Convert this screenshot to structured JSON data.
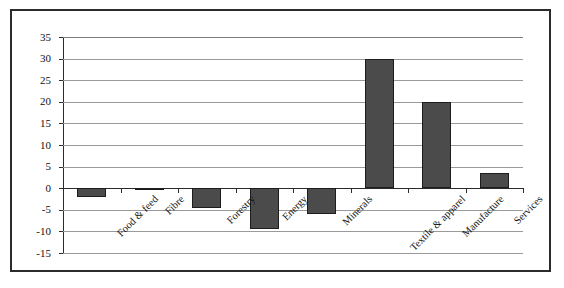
{
  "chart_data": {
    "type": "bar",
    "title": "",
    "subtitle": "",
    "xlabel": "",
    "ylabel": "",
    "categories": [
      "Food & feed",
      "Fibre",
      "Forestry",
      "Energy",
      "Minerals",
      "Textile & apparel",
      "Manufacture",
      "Services"
    ],
    "values": [
      -2,
      -0.3,
      -4.5,
      -9.5,
      -6,
      30,
      20,
      3.5
    ],
    "ylim": [
      -15,
      35
    ],
    "yticks": [
      35,
      30,
      25,
      20,
      15,
      10,
      5,
      0,
      -5,
      -10,
      -15
    ],
    "ytick_labels": [
      "35",
      "30",
      "25",
      "20",
      "15",
      "10",
      "5",
      "0",
      "-5",
      "-10",
      "-15"
    ],
    "grid": true,
    "grid_axis": "y",
    "legend": false,
    "legend_position": "none",
    "bar_color": "#4b4b4b",
    "bar_edge_color": "#1d1d1d",
    "gridline_color": "#9a9a9a",
    "axis_color": "#2b2b2b",
    "xtick_label_rotation": -45
  },
  "frame": {
    "border_color": "#2b2b2b"
  }
}
